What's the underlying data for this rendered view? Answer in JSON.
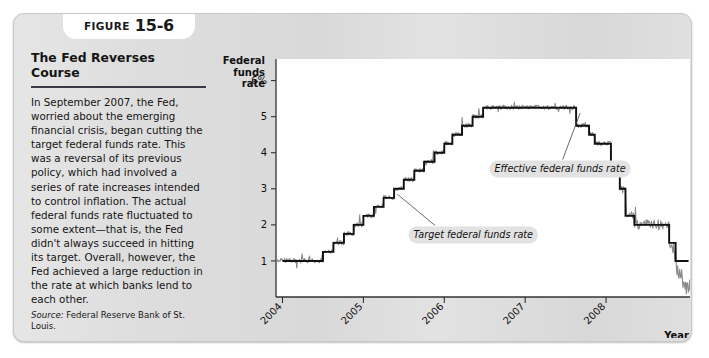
{
  "figure": {
    "badge_word": "FIGURE",
    "badge_number": "15-6",
    "title": "The Fed Reverses Course",
    "body": "In September 2007, the Fed, worried about the emerging financial crisis, began cutting the target federal funds rate. This was a reversal of its previous policy, which had involved a series of rate increases intended to control inflation. The actual federal funds rate fluctuated to some extent—that is, the Fed didn't always succeed in hitting its target. Overall, however, the Fed achieved a large reduction in the rate at which banks lend to each other.",
    "source_lead": "Source:",
    "source_text": " Federal Reserve Bank of St. Louis."
  },
  "chart_data": {
    "type": "line",
    "title": "",
    "ylabel": "Federal funds rate",
    "xlabel": "Year",
    "ylim": [
      0,
      6.6
    ],
    "xlim": [
      2003.92,
      2009.05
    ],
    "yticks": [
      1,
      2,
      3,
      4,
      5,
      6
    ],
    "ytick_labels": [
      "1",
      "2",
      "3",
      "4",
      "5",
      "6%"
    ],
    "xticks": [
      2004,
      2005,
      2006,
      2007,
      2008
    ],
    "xtick_labels": [
      "2004",
      "2005",
      "2006",
      "2007",
      "2008"
    ],
    "grid": false,
    "legend_position": "annotations",
    "series": [
      {
        "name": "Target federal funds rate",
        "color": "#111111",
        "style": "step",
        "x": [
          2004.0,
          2004.5,
          2004.5,
          2004.63,
          2004.63,
          2004.76,
          2004.76,
          2004.88,
          2004.88,
          2005.0,
          2005.0,
          2005.13,
          2005.13,
          2005.25,
          2005.25,
          2005.38,
          2005.38,
          2005.5,
          2005.5,
          2005.63,
          2005.63,
          2005.75,
          2005.75,
          2005.88,
          2005.88,
          2006.0,
          2006.0,
          2006.1,
          2006.1,
          2006.22,
          2006.22,
          2006.35,
          2006.35,
          2006.48,
          2006.48,
          2006.6,
          2006.6,
          2007.63,
          2007.63,
          2007.79,
          2007.79,
          2007.86,
          2007.86,
          2008.06,
          2008.06,
          2008.17,
          2008.17,
          2008.24,
          2008.24,
          2008.35,
          2008.35,
          2008.78,
          2008.78,
          2008.86,
          2008.86,
          2009.02
        ],
        "y": [
          1.0,
          1.0,
          1.25,
          1.25,
          1.5,
          1.5,
          1.75,
          1.75,
          2.0,
          2.0,
          2.25,
          2.25,
          2.5,
          2.5,
          2.75,
          2.75,
          3.0,
          3.0,
          3.25,
          3.25,
          3.5,
          3.5,
          3.75,
          3.75,
          4.0,
          4.0,
          4.25,
          4.25,
          4.5,
          4.5,
          4.75,
          4.75,
          5.0,
          5.0,
          5.25,
          5.25,
          5.25,
          5.25,
          4.75,
          4.75,
          4.5,
          4.5,
          4.25,
          4.25,
          3.5,
          3.5,
          3.0,
          3.0,
          2.25,
          2.25,
          2.0,
          2.0,
          1.5,
          1.5,
          1.0,
          1.0
        ]
      },
      {
        "name": "Effective federal funds rate",
        "color": "#8a8a8a",
        "style": "noisy",
        "noise": 0.12,
        "end_dip": 0.25
      }
    ],
    "annotations": [
      {
        "label": "Effective federal funds rate",
        "text_x": 2006.62,
        "text_y": 3.55,
        "point_x": 2007.68,
        "point_y": 5.1
      },
      {
        "label": "Target federal funds rate",
        "text_x": 2005.62,
        "text_y": 1.72,
        "point_x": 2005.42,
        "point_y": 2.85
      }
    ]
  }
}
